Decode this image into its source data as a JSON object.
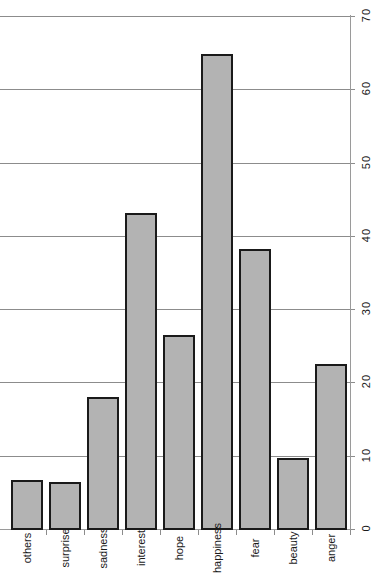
{
  "chart_data": {
    "type": "bar",
    "orientation": "horizontal-rotated",
    "title": "",
    "xlabel": "",
    "ylabel": "",
    "categories": [
      "anger",
      "beauty",
      "fear",
      "happiness",
      "hope",
      "interest",
      "sadness",
      "surprise",
      "others"
    ],
    "values": [
      22.7,
      9.8,
      38.4,
      65.0,
      26.6,
      43.2,
      18.2,
      6.5,
      6.8
    ],
    "ticks": [
      "0",
      "10",
      "20",
      "30",
      "40",
      "50",
      "60",
      "70"
    ],
    "tick_values": [
      0,
      10,
      20,
      30,
      40,
      50,
      60,
      70
    ],
    "ylim": [
      0,
      70
    ],
    "grid": true,
    "legend": "none",
    "bar_fill_color": "#b3b3b3",
    "bar_edge_color": "#1a1a1a",
    "grid_color": "#8c8c8c",
    "background_color": "#ffffff"
  }
}
